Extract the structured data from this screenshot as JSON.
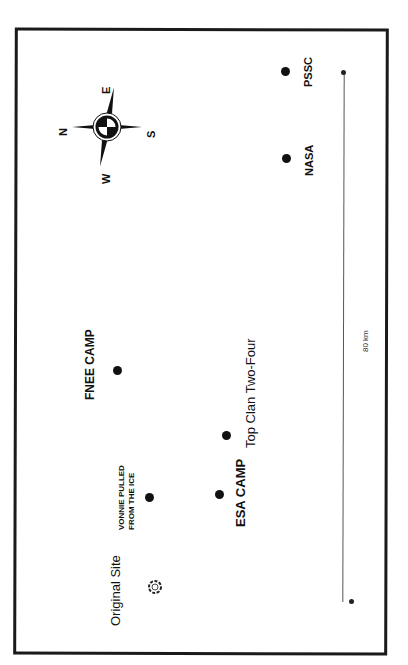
{
  "map": {
    "locations": [
      {
        "name": "Original Site",
        "marker": "wreath-icon"
      },
      {
        "name": "VONNIE PULLED",
        "name_line2": "FROM THE ICE",
        "marker": "dot"
      },
      {
        "name": "FNEE CAMP",
        "marker": "dot"
      },
      {
        "name": "ESA CAMP",
        "marker": "dot"
      },
      {
        "name": "Top Clan Two-Four",
        "marker": "dot"
      },
      {
        "name": "NASA",
        "marker": "dot"
      },
      {
        "name": "PSSC",
        "marker": "dot"
      }
    ],
    "compass": {
      "n": "N",
      "e": "E",
      "s": "S",
      "w": "W"
    },
    "scale_bar": {
      "label": "80 km"
    }
  }
}
